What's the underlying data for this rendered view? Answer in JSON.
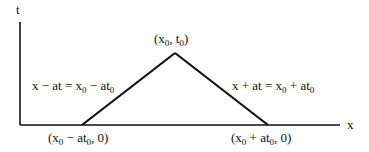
{
  "axes": {
    "vertical_label": "t",
    "horizontal_label": "x"
  },
  "apex": {
    "x": "x",
    "x_sub": "0",
    "t": "t",
    "t_sub": "0"
  },
  "left_line": {
    "lhs": "x − at = x",
    "sub1": "0",
    "rhs": " − at",
    "sub2": "0"
  },
  "right_line": {
    "lhs": "x + at = x",
    "sub1": "0",
    "rhs": " + at",
    "sub2": "0"
  },
  "left_foot": {
    "a": "(x",
    "sub1": "0",
    "b": " − at",
    "sub2": "0",
    "c": ", 0)"
  },
  "right_foot": {
    "a": "(x",
    "sub1": "0",
    "b": " + at",
    "sub2": "0",
    "c": ", 0)"
  },
  "colors": {
    "line": "#111111",
    "background": "#ffffff"
  }
}
